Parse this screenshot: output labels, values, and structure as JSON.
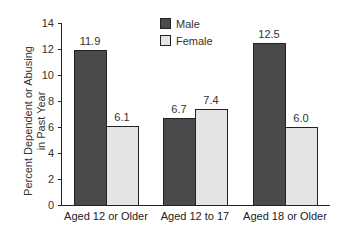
{
  "chart_data": {
    "type": "bar",
    "title": "",
    "xlabel": "",
    "ylabel": "Percent Dependent or Abusing in Past Year",
    "ylabel_lines": [
      "Percent Dependent or Abusing",
      "in Past Year"
    ],
    "categories": [
      "Aged 12 or Older",
      "Aged 12 to 17",
      "Aged 18 or  Older"
    ],
    "series": [
      {
        "name": "Male",
        "values": [
          11.9,
          6.7,
          12.5
        ],
        "color": "#4a4a4a"
      },
      {
        "name": "Female",
        "values": [
          6.1,
          7.4,
          6.0
        ],
        "color": "#e4e4e4"
      }
    ],
    "value_labels": [
      [
        "11.9",
        "6.7",
        "12.5"
      ],
      [
        "6.1",
        "7.4",
        "6.0"
      ]
    ],
    "ylim": [
      0,
      14
    ],
    "yticks": [
      "0",
      "2",
      "4",
      "6",
      "8",
      "10",
      "12",
      "14"
    ],
    "grid": false,
    "legend_position": "top-center"
  },
  "legend": {
    "items": [
      {
        "label": "Male",
        "color": "#4a4a4a"
      },
      {
        "label": "Female",
        "color": "#e4e4e4"
      }
    ]
  }
}
